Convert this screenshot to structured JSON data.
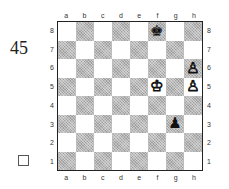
{
  "diagram": {
    "number": "45",
    "to_move": "white",
    "files": [
      "a",
      "b",
      "c",
      "d",
      "e",
      "f",
      "g",
      "h"
    ],
    "ranks": [
      "8",
      "7",
      "6",
      "5",
      "4",
      "3",
      "2",
      "1"
    ],
    "pieces": [
      {
        "square": "f8",
        "piece": "king",
        "color": "black",
        "glyph": "♚"
      },
      {
        "square": "h6",
        "piece": "pawn",
        "color": "white",
        "glyph": "♙"
      },
      {
        "square": "h5",
        "piece": "pawn",
        "color": "white",
        "glyph": "♙"
      },
      {
        "square": "f5",
        "piece": "king",
        "color": "white",
        "glyph": "♔"
      },
      {
        "square": "g3",
        "piece": "pawn",
        "color": "black",
        "glyph": "♟"
      }
    ],
    "colors": {
      "light_square": "#ffffff",
      "dark_square": "#b8b8b8",
      "border": "#222222"
    }
  }
}
